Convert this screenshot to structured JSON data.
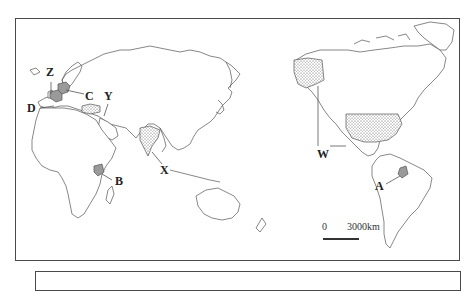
{
  "map": {
    "type": "world map (Pacific-centred)",
    "labels": {
      "A": "A",
      "B": "B",
      "C": "C",
      "D": "D",
      "W": "W",
      "X": "X",
      "Y": "Y",
      "Z": "Z"
    },
    "regions": [
      {
        "label": "A",
        "fill": "grey",
        "location": "Ecuador (South America)"
      },
      {
        "label": "B",
        "fill": "grey",
        "location": "Kenya (East Africa)"
      },
      {
        "label": "C",
        "fill": "grey",
        "location": "Germany (Central Europe)"
      },
      {
        "label": "D",
        "fill": "grey",
        "location": "France (Western Europe)"
      },
      {
        "label": "W",
        "fill": "dotted",
        "location": "United States incl. Alaska"
      },
      {
        "label": "X",
        "fill": "dotted",
        "location": "India (South Asia)"
      },
      {
        "label": "Y",
        "fill": "dotted",
        "location": "Turkey"
      },
      {
        "label": "Z",
        "fill": "none",
        "location": "United Kingdom"
      }
    ],
    "scale": {
      "zero": "0",
      "distance": "3000km"
    },
    "colors": {
      "frame": "#4a4a4a",
      "coast": "#555555",
      "shaded": "#9a9a9a"
    }
  }
}
